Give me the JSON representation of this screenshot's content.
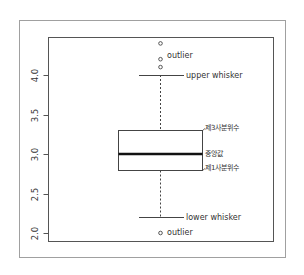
{
  "chart_data": {
    "type": "box",
    "title": "",
    "xlabel": "",
    "ylabel": "",
    "ylim": [
      1.95,
      4.55
    ],
    "yticks": [
      2.0,
      2.5,
      3.0,
      3.5,
      4.0
    ],
    "ytick_labels": [
      "2.0",
      "2.5",
      "3.0",
      "3.5",
      "4.0"
    ],
    "grid": false,
    "legend": null,
    "box": {
      "lower_whisker": 2.2,
      "q1": 2.8,
      "median": 3.0,
      "q3": 3.3,
      "upper_whisker": 4.0,
      "outliers": [
        4.4,
        4.2,
        4.1,
        2.0
      ]
    },
    "annotations": [
      {
        "key": "outlier_top",
        "text": "outlier",
        "y": 4.2
      },
      {
        "key": "upper_whisker",
        "text": "upper whisker",
        "y": 4.0
      },
      {
        "key": "q3",
        "text": "제3사분위수",
        "y": 3.3
      },
      {
        "key": "median",
        "text": "중앙값",
        "y": 3.0
      },
      {
        "key": "q1",
        "text": "제1사분위수",
        "y": 2.8
      },
      {
        "key": "lower_whisker",
        "text": "lower whisker",
        "y": 2.2
      },
      {
        "key": "outlier_bottom",
        "text": "outlier",
        "y": 2.0
      }
    ]
  },
  "colors": {
    "frame": "#9a9a9a",
    "axis": "#555555",
    "box": "#444444",
    "median": "#111111",
    "text": "#333333"
  }
}
